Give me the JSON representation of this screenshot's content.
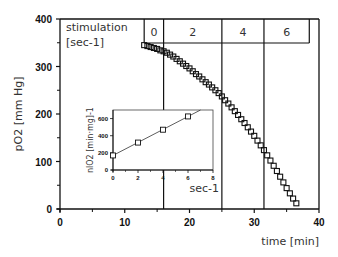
{
  "chart_data": {
    "type": "scatter",
    "title": "",
    "xlabel": "time [min]",
    "ylabel": "pO2 [mm Hg]",
    "xlim": [
      0,
      40
    ],
    "ylim": [
      0,
      400
    ],
    "x_ticks": [
      "0",
      "10",
      "20",
      "30",
      "40"
    ],
    "y_ticks": [
      "0",
      "100",
      "200",
      "300",
      "400"
    ],
    "stimulation_header": {
      "label": "stimulation",
      "unit": "[sec-1]",
      "segments": [
        {
          "label": "0",
          "x_start": 13,
          "x_end": 16
        },
        {
          "label": "2",
          "x_start": 16,
          "x_end": 25
        },
        {
          "label": "4",
          "x_start": 25,
          "x_end": 31.5
        },
        {
          "label": "6",
          "x_start": 31.5,
          "x_end": 38.5
        }
      ]
    },
    "series": [
      {
        "name": "pO2",
        "marker": "square-open",
        "x": [
          13.0,
          13.5,
          14.0,
          14.5,
          15.0,
          15.5,
          16.0,
          16.5,
          17.0,
          17.5,
          18.0,
          18.5,
          19.0,
          19.5,
          20.0,
          20.5,
          21.0,
          21.5,
          22.0,
          22.5,
          23.0,
          23.5,
          24.0,
          24.5,
          25.0,
          25.5,
          26.0,
          26.5,
          27.0,
          27.5,
          28.0,
          28.5,
          29.0,
          29.5,
          30.0,
          30.5,
          31.0,
          31.5,
          32.0,
          32.5,
          33.0,
          33.5,
          34.0,
          34.5,
          35.0,
          35.5,
          36.0,
          36.5
        ],
        "y": [
          345,
          343,
          341,
          339,
          337,
          334,
          332,
          329,
          325,
          321,
          316,
          311,
          306,
          301,
          296,
          290,
          284,
          279,
          273,
          267,
          262,
          256,
          250,
          244,
          237,
          229,
          222,
          214,
          206,
          198,
          189,
          181,
          172,
          163,
          154,
          144,
          134,
          124,
          113,
          102,
          91,
          80,
          68,
          56,
          44,
          33,
          22,
          12
        ]
      }
    ],
    "inset": {
      "type": "line",
      "xlabel": "sec-1",
      "ylabel": "nlO2 [min·mg]-1",
      "xlim": [
        0,
        8
      ],
      "ylim": [
        0,
        700
      ],
      "x_ticks": [
        "0",
        "2",
        "4",
        "6",
        "8"
      ],
      "y_ticks": [
        "0",
        "200",
        "400",
        "600"
      ],
      "x": [
        0,
        2,
        4,
        6
      ],
      "y": [
        170,
        320,
        470,
        625
      ],
      "fit_line": {
        "x": [
          0,
          7
        ],
        "y": [
          170,
          700
        ]
      }
    },
    "grid": false,
    "legend": "none"
  }
}
